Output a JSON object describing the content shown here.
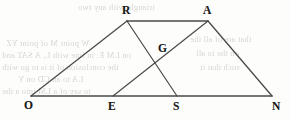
{
  "figure": {
    "background_color": "#fdfdfc",
    "stroke_color": "#4a4a4a",
    "label_color": "#1c1c1c",
    "width": 291,
    "height": 121,
    "points": [
      {
        "id": "O",
        "label": "O",
        "x": 31,
        "y": 96,
        "label_x": 24,
        "label_y": 100
      },
      {
        "id": "E",
        "label": "E",
        "x": 113,
        "y": 96,
        "label_x": 108,
        "label_y": 101
      },
      {
        "id": "S",
        "label": "S",
        "x": 177,
        "y": 96,
        "label_x": 173,
        "label_y": 101
      },
      {
        "id": "N",
        "label": "N",
        "x": 272,
        "y": 96,
        "label_x": 272,
        "label_y": 101
      },
      {
        "id": "R",
        "label": "R",
        "x": 127,
        "y": 21,
        "label_x": 122,
        "label_y": 5
      },
      {
        "id": "A",
        "label": "A",
        "x": 208,
        "y": 21,
        "label_x": 203,
        "label_y": 5
      },
      {
        "id": "G",
        "label": "G",
        "x": 167,
        "y": 60,
        "label_x": 158,
        "label_y": 43
      }
    ],
    "segments": [
      {
        "name": "base-O-N",
        "from": "O",
        "to": "N",
        "width": 1.5
      },
      {
        "name": "side-O-R",
        "from": "O",
        "to": "R",
        "width": 1.3
      },
      {
        "name": "top-R-A",
        "from": "R",
        "to": "A",
        "width": 1.5
      },
      {
        "name": "side-A-N",
        "from": "A",
        "to": "N",
        "width": 1.3
      },
      {
        "name": "cevian-R-S",
        "from": "R",
        "to": "S",
        "width": 1.2
      },
      {
        "name": "cevian-E-A",
        "from": "E",
        "to": "A",
        "width": 1.2
      }
    ]
  },
  "ghost_text": {
    "note": "Faint show-through text from the reverse side of the scanned page",
    "lines": [
      {
        "text": "triangle with any two",
        "x": 78,
        "y": 2,
        "size": 8.5
      },
      {
        "text": "W point M of point YZ",
        "x": 6,
        "y": 38,
        "size": 8.5
      },
      {
        "text": "on LM E: in line with L, A SAT and",
        "x": 2,
        "y": 50,
        "size": 8.5
      },
      {
        "text": "the conclusion of it is to go with",
        "x": 2,
        "y": 62,
        "size": 8.5
      },
      {
        "text": "LA to an CD on Y",
        "x": 18,
        "y": 74,
        "size": 8.5
      },
      {
        "text": "to say of a LM into a the",
        "x": 2,
        "y": 86,
        "size": 8.5
      },
      {
        "text": "that are of all the",
        "x": 190,
        "y": 34,
        "size": 8.5
      },
      {
        "text": "on the to all",
        "x": 196,
        "y": 48,
        "size": 8.5
      },
      {
        "text": "such that it",
        "x": 200,
        "y": 62,
        "size": 8.5
      }
    ]
  }
}
